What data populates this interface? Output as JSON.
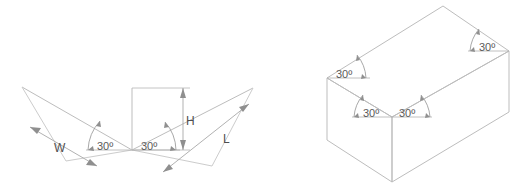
{
  "figure": {
    "line_color": "#b9b9b9",
    "dim_line_color": "#9a9a9a",
    "text_color": "#5a5a5a",
    "background": "#ffffff"
  },
  "left_figure": {
    "name": "isometric-axes-diagram",
    "dimension_labels": {
      "width": "W",
      "height": "H",
      "length": "L"
    },
    "angles": [
      {
        "id": "left-axis-angle",
        "value": "30º"
      },
      {
        "id": "right-axis-angle",
        "value": "30º"
      }
    ]
  },
  "right_figure": {
    "name": "isometric-box-diagram",
    "angles": [
      {
        "id": "box-top-right-angle",
        "value": "30º"
      },
      {
        "id": "box-top-left-angle",
        "value": "30º"
      },
      {
        "id": "box-front-left-angle",
        "value": "30º"
      },
      {
        "id": "box-front-right-angle",
        "value": "30º"
      }
    ]
  }
}
